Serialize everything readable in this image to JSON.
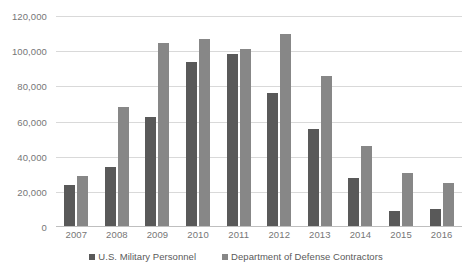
{
  "chart_data": {
    "type": "bar",
    "title": "",
    "xlabel": "",
    "ylabel": "",
    "categories": [
      "2007",
      "2008",
      "2009",
      "2010",
      "2011",
      "2012",
      "2013",
      "2014",
      "2015",
      "2016"
    ],
    "series": [
      {
        "name": "U.S. Military Personnel",
        "color": "#595959",
        "values": [
          24000,
          34000,
          62500,
          94000,
          98500,
          76000,
          56000,
          28000,
          9000,
          10000
        ]
      },
      {
        "name": "Department of Defense Contractors",
        "color": "#878787",
        "values": [
          29000,
          68000,
          104500,
          107000,
          101500,
          110000,
          86000,
          46000,
          31000,
          25000
        ]
      }
    ],
    "ylim": [
      0,
      120000
    ],
    "ytick_values": [
      0,
      20000,
      40000,
      60000,
      80000,
      100000,
      120000
    ],
    "ytick_labels": [
      "0",
      "20,000",
      "40,000",
      "60,000",
      "80,000",
      "100,000",
      "120,000"
    ],
    "grid": true,
    "legend_position": "bottom",
    "axis_color": "#d9d9d9",
    "label_color": "#767676"
  }
}
